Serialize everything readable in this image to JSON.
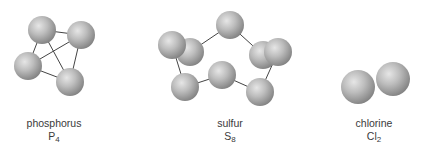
{
  "molecules": [
    {
      "id": "phosphorus",
      "name": "phosphorus",
      "symbol": "P",
      "subscript": "4",
      "label_center_x": 54,
      "atoms": [
        {
          "x": 42,
          "y": 30
        },
        {
          "x": 81,
          "y": 35
        },
        {
          "x": 28,
          "y": 66
        },
        {
          "x": 70,
          "y": 82
        }
      ],
      "bonds": [
        [
          0,
          1
        ],
        [
          0,
          2
        ],
        [
          0,
          3
        ],
        [
          1,
          2
        ],
        [
          1,
          3
        ],
        [
          2,
          3
        ]
      ],
      "atom_radius": 14
    },
    {
      "id": "sulfur",
      "name": "sulfur",
      "symbol": "S",
      "subscript": "8",
      "label_center_x": 230,
      "atoms": [
        {
          "x": 190,
          "y": 52
        },
        {
          "x": 172,
          "y": 45
        },
        {
          "x": 230,
          "y": 25
        },
        {
          "x": 263,
          "y": 55
        },
        {
          "x": 278,
          "y": 52
        },
        {
          "x": 185,
          "y": 87
        },
        {
          "x": 222,
          "y": 75
        },
        {
          "x": 260,
          "y": 92
        }
      ],
      "bonds": [
        [
          0,
          2
        ],
        [
          2,
          3
        ],
        [
          1,
          5
        ],
        [
          5,
          6
        ],
        [
          6,
          7
        ],
        [
          7,
          4
        ]
      ],
      "atom_radius": 14
    },
    {
      "id": "chlorine",
      "name": "chlorine",
      "symbol": "Cl",
      "subscript": "2",
      "label_center_x": 374,
      "atoms": [
        {
          "x": 358,
          "y": 87
        },
        {
          "x": 393,
          "y": 79
        }
      ],
      "bonds": [],
      "atom_radius": 17
    }
  ],
  "colors": {
    "atom_highlight": "#e2e2e2",
    "atom_mid": "#b0b0b0",
    "atom_shadow": "#7a7a7a",
    "bond": "#444444",
    "label": "#3a3a3a"
  }
}
